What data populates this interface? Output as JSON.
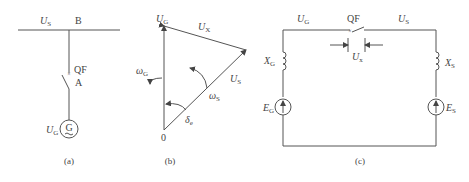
{
  "panels": {
    "a": {
      "caption": "(a)",
      "bus_voltage": {
        "main": "U",
        "sub": "S"
      },
      "bus_label": "B",
      "breaker_label": "QF",
      "point_label": "A",
      "gen_voltage": {
        "main": "U",
        "sub": "G"
      },
      "gen_symbol": "G"
    },
    "b": {
      "caption": "(b)",
      "origin": "0",
      "ug": {
        "main": "U",
        "sub": "G",
        "dot": "·"
      },
      "ux": {
        "main": "U",
        "sub": "X",
        "dot": "·"
      },
      "us": {
        "main": "U",
        "sub": "S"
      },
      "omega_g": {
        "main": "ω",
        "sub": "G"
      },
      "omega_s": {
        "main": "ω",
        "sub": "S"
      },
      "delta": {
        "main": "δ",
        "sub": "e"
      }
    },
    "c": {
      "caption": "(c)",
      "ug": {
        "main": "U",
        "sub": "G",
        "dot": "·"
      },
      "qf": "QF",
      "us": {
        "main": "U",
        "sub": "S"
      },
      "ux": {
        "main": "U",
        "sub": "x",
        "dot": "·"
      },
      "xg": {
        "main": "X",
        "sub": "G"
      },
      "xs": {
        "main": "X",
        "sub": "S"
      },
      "eg": {
        "main": "E",
        "sub": "G",
        "dot": "·"
      },
      "es": {
        "main": "E",
        "sub": "S",
        "dot": "·"
      }
    }
  }
}
